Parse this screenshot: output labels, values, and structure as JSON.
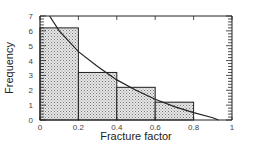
{
  "chart_data": {
    "type": "bar",
    "subtype": "histogram-with-fitted-curve",
    "title": "",
    "xlabel": "Fracture factor",
    "ylabel": "Frequency",
    "xlim": [
      0,
      1
    ],
    "ylim": [
      0,
      7
    ],
    "x_ticks": [
      "0",
      "0.2",
      "0.4",
      "0.6",
      "0.8",
      "1"
    ],
    "y_ticks": [
      "0",
      "1",
      "2",
      "3",
      "4",
      "5",
      "6",
      "7"
    ],
    "bins": [
      {
        "x0": 0.0,
        "x1": 0.2,
        "value": 6.2
      },
      {
        "x0": 0.2,
        "x1": 0.4,
        "value": 3.2
      },
      {
        "x0": 0.4,
        "x1": 0.6,
        "value": 2.2
      },
      {
        "x0": 0.6,
        "x1": 0.8,
        "value": 1.2
      }
    ],
    "categories": [
      "0-0.2",
      "0.2-0.4",
      "0.4-0.6",
      "0.6-0.8"
    ],
    "values": [
      6.2,
      3.2,
      2.2,
      1.2
    ],
    "curve": {
      "name": "fitted distribution",
      "points": [
        [
          0.05,
          7.0
        ],
        [
          0.1,
          6.0
        ],
        [
          0.2,
          4.6
        ],
        [
          0.3,
          3.6
        ],
        [
          0.4,
          2.7
        ],
        [
          0.5,
          2.0
        ],
        [
          0.6,
          1.4
        ],
        [
          0.7,
          0.9
        ],
        [
          0.8,
          0.5
        ],
        [
          0.9,
          0.15
        ],
        [
          0.93,
          0.0
        ]
      ]
    },
    "grid": false,
    "legend": null,
    "fill_pattern": "stippled"
  }
}
